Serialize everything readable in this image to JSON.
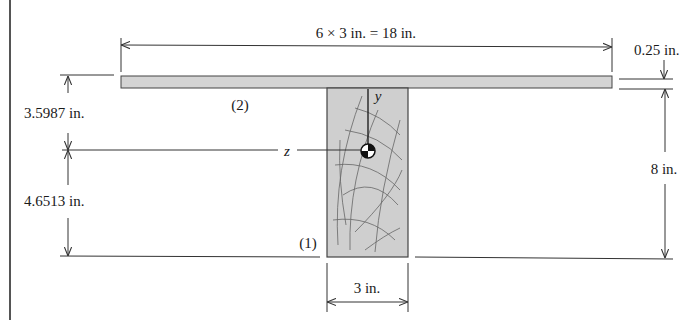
{
  "figure": {
    "type": "composite T-beam cross-section",
    "colors": {
      "line": "#333333",
      "plate_fill": "#d4d4d4",
      "web_fill": "#cfcfcf",
      "grain": "#555555",
      "background": "#ffffff"
    }
  },
  "labels": {
    "top_width": "6 × 3 in. = 18 in.",
    "plate_thickness": "0.25 in.",
    "upper_distance": "3.5987 in.",
    "lower_distance": "4.6513 in.",
    "web_height": "8 in.",
    "web_width": "3 in.",
    "plate_id": "(2)",
    "web_id": "(1)",
    "z_axis": "z",
    "y_axis": "y"
  },
  "components": [
    {
      "id": "(1)",
      "description": "wood web",
      "width_in": 3,
      "height_in": 8
    },
    {
      "id": "(2)",
      "description": "steel plate",
      "width_in": 18,
      "thickness_in": 0.25
    }
  ],
  "centroid": {
    "distance_from_top_in": 3.5987,
    "distance_from_bottom_in": 4.6513
  }
}
